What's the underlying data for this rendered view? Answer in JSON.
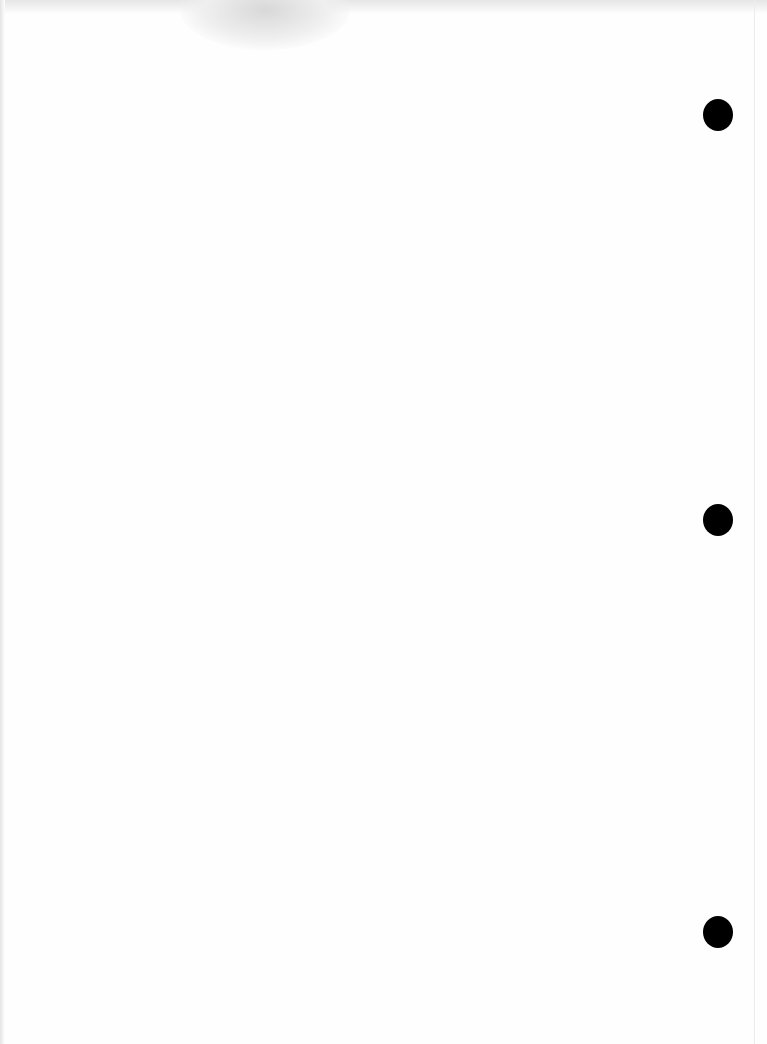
{
  "page": {
    "content": "",
    "punch_holes": [
      {
        "x": 718,
        "y": 115
      },
      {
        "x": 718,
        "y": 520
      },
      {
        "x": 718,
        "y": 932
      }
    ]
  }
}
